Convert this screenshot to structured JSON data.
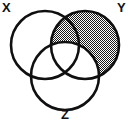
{
  "figure": {
    "type": "venn-diagram",
    "sets": 3,
    "background_color": "#ffffff",
    "stroke_color": "#101010",
    "stroke_width": 2.6,
    "shading_color": "#6e6e6e",
    "shading_pattern": "stipple-checker",
    "width": 130,
    "height": 124
  },
  "labels": {
    "x": "X",
    "y": "Y",
    "z": "Z"
  },
  "circles": [
    {
      "id": "x",
      "label": "X",
      "cx": 45,
      "cy": 45,
      "r": 34,
      "shaded": false
    },
    {
      "id": "y",
      "label": "Y",
      "cx": 85,
      "cy": 45,
      "r": 34,
      "shaded": true
    },
    {
      "id": "z",
      "label": "Z",
      "cx": 65,
      "cy": 76,
      "r": 34,
      "shaded": false
    }
  ],
  "shaded_region": {
    "description": "Y minus Z",
    "expression": "Y \\ Z",
    "includes": [
      "Y only",
      "X and Y not Z"
    ],
    "excludes": [
      "Y and Z",
      "X and Y and Z"
    ]
  }
}
